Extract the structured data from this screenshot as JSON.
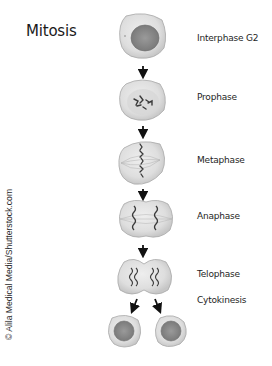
{
  "title": "Mitosis",
  "credit": "© Alila Medical Media/Shutterstock.com",
  "stages": [
    {
      "label": "Interphase G2",
      "icon": "interphase-cell"
    },
    {
      "label": "Prophase",
      "icon": "prophase-cell"
    },
    {
      "label": "Metaphase",
      "icon": "metaphase-cell"
    },
    {
      "label": "Anaphase",
      "icon": "anaphase-cell"
    },
    {
      "label": "Telophase",
      "icon": "telophase-cell"
    },
    {
      "label": "Cytokinesis",
      "icon": "daughter-cells"
    }
  ],
  "colors": {
    "cell_fill": "#e2e2e2",
    "cell_stroke": "#9a9a9a",
    "nucleus": "#8c8c8c",
    "chromosome": "#3a3a3a",
    "arrow": "#111111"
  }
}
